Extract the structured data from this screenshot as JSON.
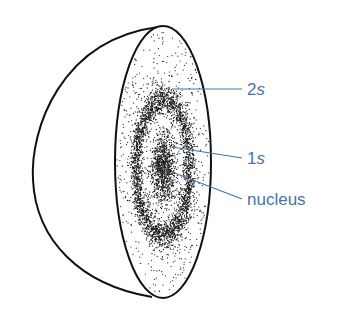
{
  "figure": {
    "labels": [
      {
        "id": "2s",
        "number": "2",
        "letter": "s",
        "x": 245,
        "y": 81
      },
      {
        "id": "1s",
        "number": "1",
        "letter": "s",
        "x": 245,
        "y": 148
      },
      {
        "id": "nucleus",
        "text": "nucleus",
        "x": 245,
        "y": 191
      }
    ],
    "colors": {
      "outline": "#111111",
      "dots": "#1a1a1a",
      "label": "#4a72a8",
      "background": "#ffffff"
    }
  }
}
